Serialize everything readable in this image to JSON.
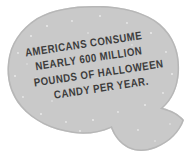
{
  "canvas": {
    "width": 195,
    "height": 158,
    "background_color": "#ffffff"
  },
  "bubble": {
    "name": "speech-bubble",
    "shape": "rounded-blob-oval-with-crescent-tail",
    "fill_color": "#c9c9c9",
    "edge_shadow_color": "#b3b3b3",
    "speckle_color": "#e8e8e8",
    "tail": {
      "name": "speech-bubble-tail",
      "shape": "crescent-hook",
      "direction": "down-right"
    }
  },
  "quote": {
    "text_color": "#3c3c3c",
    "rotation_degrees": -8.5,
    "full_text": "AMERICANS CONSUME NEARLY 600 MILLION POUNDS OF HALLOWEEN CANDY PER YEAR.",
    "lines": [
      "AMERICANS CONSUME",
      "NEARLY 600 MILLION",
      "POUNDS OF HALLOWEEN",
      "CANDY PER YEAR."
    ]
  }
}
